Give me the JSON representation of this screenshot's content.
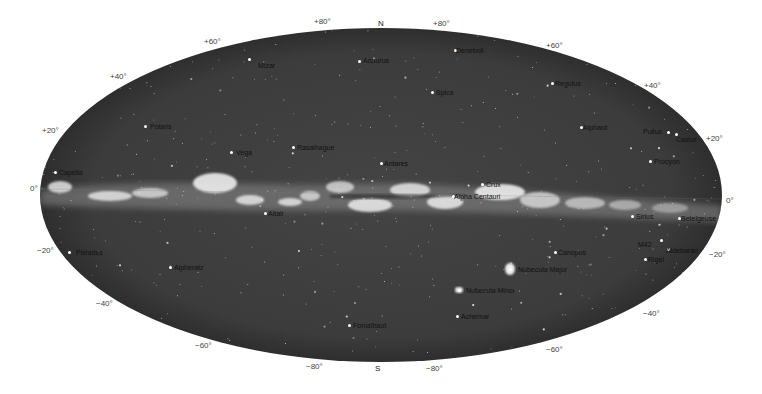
{
  "map": {
    "projection": "ellipse",
    "colors": {
      "sky": "#3e3e3e",
      "sky_edge": "#2f2f2f",
      "milky_way": "#e8e8e8",
      "background": "#ffffff",
      "label": "#111111",
      "coord": "#444444"
    },
    "directions": [
      {
        "text": "N",
        "x": 378,
        "y": 19
      },
      {
        "text": "S",
        "x": 375,
        "y": 364
      }
    ],
    "coord_labels": [
      {
        "text": "+80°",
        "x": 314,
        "y": 17
      },
      {
        "text": "+80°",
        "x": 433,
        "y": 19
      },
      {
        "text": "+60°",
        "x": 204,
        "y": 37
      },
      {
        "text": "+60°",
        "x": 546,
        "y": 41
      },
      {
        "text": "+40°",
        "x": 110,
        "y": 72
      },
      {
        "text": "+40°",
        "x": 644,
        "y": 81
      },
      {
        "text": "+20°",
        "x": 42,
        "y": 126
      },
      {
        "text": "+20°",
        "x": 706,
        "y": 134
      },
      {
        "text": "0°",
        "x": 30,
        "y": 184
      },
      {
        "text": "0°",
        "x": 726,
        "y": 196
      },
      {
        "text": "−20°",
        "x": 37,
        "y": 246
      },
      {
        "text": "−20°",
        "x": 709,
        "y": 250
      },
      {
        "text": "−40°",
        "x": 96,
        "y": 299
      },
      {
        "text": "−40°",
        "x": 643,
        "y": 309
      },
      {
        "text": "−60°",
        "x": 195,
        "y": 341
      },
      {
        "text": "−60°",
        "x": 546,
        "y": 345
      },
      {
        "text": "−80°",
        "x": 306,
        "y": 362
      },
      {
        "text": "−80°",
        "x": 426,
        "y": 364
      }
    ],
    "stars": [
      {
        "name": "Mizar",
        "sx": 249,
        "sy": 59,
        "x": 258,
        "y": 62
      },
      {
        "name": "Arcturus",
        "sx": 359,
        "sy": 61,
        "x": 363,
        "y": 57
      },
      {
        "name": "Deneboli",
        "sx": 455,
        "sy": 50,
        "x": 456,
        "y": 47
      },
      {
        "name": "Spica",
        "sx": 432,
        "sy": 92,
        "x": 436,
        "y": 89
      },
      {
        "name": "Regulus",
        "sx": 552,
        "sy": 83,
        "x": 555,
        "y": 80
      },
      {
        "name": "Polaris",
        "sx": 145,
        "sy": 126,
        "x": 150,
        "y": 123
      },
      {
        "name": "Vega",
        "sx": 231,
        "sy": 152,
        "x": 236,
        "y": 149
      },
      {
        "name": "Rasalhague",
        "sx": 293,
        "sy": 147,
        "x": 297,
        "y": 144
      },
      {
        "name": "Antares",
        "sx": 381,
        "sy": 163,
        "x": 384,
        "y": 160
      },
      {
        "name": "Alphard",
        "sx": 581,
        "sy": 127,
        "x": 583,
        "y": 124
      },
      {
        "name": "Pollux",
        "sx": 668,
        "sy": 132,
        "x": 643,
        "y": 128
      },
      {
        "name": "Castor",
        "sx": 676,
        "sy": 134,
        "x": 676,
        "y": 136
      },
      {
        "name": "Procyon",
        "sx": 650,
        "sy": 161,
        "x": 654,
        "y": 158
      },
      {
        "name": "Capella",
        "sx": 55,
        "sy": 172,
        "x": 59,
        "y": 169
      },
      {
        "name": "Crux",
        "sx": 482,
        "sy": 184,
        "x": 486,
        "y": 181
      },
      {
        "name": "Alpha Centauri",
        "sx": 453,
        "sy": 196,
        "x": 454,
        "y": 193
      },
      {
        "name": "Altair",
        "sx": 265,
        "sy": 213,
        "x": 268,
        "y": 210
      },
      {
        "name": "Sirius",
        "sx": 632,
        "sy": 216,
        "x": 636,
        "y": 213
      },
      {
        "name": "Betelgeuse",
        "sx": 679,
        "sy": 218,
        "x": 681,
        "y": 215
      },
      {
        "name": "M42",
        "sx": 661,
        "sy": 240,
        "x": 638,
        "y": 241
      },
      {
        "name": "Aldebaran",
        "sx": 668,
        "sy": 249,
        "x": 666,
        "y": 247
      },
      {
        "name": "Rigel",
        "sx": 645,
        "sy": 259,
        "x": 648,
        "y": 256
      },
      {
        "name": "Canopus",
        "sx": 555,
        "sy": 252,
        "x": 558,
        "y": 249
      },
      {
        "name": "Pleiades",
        "sx": 69,
        "sy": 252,
        "x": 76,
        "y": 249
      },
      {
        "name": "Alpheratz",
        "sx": 170,
        "sy": 267,
        "x": 174,
        "y": 264
      },
      {
        "name": "Nubecula Major",
        "sx": 510,
        "sy": 269,
        "x": 518,
        "y": 266
      },
      {
        "name": "Nubecula Minor",
        "sx": 459,
        "sy": 290,
        "x": 466,
        "y": 287
      },
      {
        "name": "Achernar",
        "sx": 457,
        "sy": 316,
        "x": 461,
        "y": 313
      },
      {
        "name": "Fomalhaut",
        "sx": 349,
        "sy": 325,
        "x": 353,
        "y": 322
      }
    ]
  }
}
